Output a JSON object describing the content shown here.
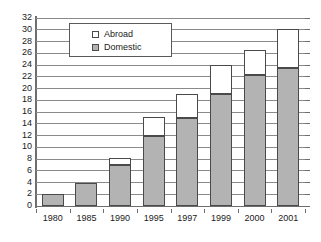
{
  "chart_data": {
    "type": "bar",
    "stacked": true,
    "title": "",
    "subtitle": "",
    "xlabel": "",
    "ylabel": "",
    "categories": [
      "1980",
      "1985",
      "1990",
      "1995",
      "1997",
      "1999",
      "2000",
      "2001"
    ],
    "series": [
      {
        "name": "Domestic",
        "color": "#b3b3b3",
        "values": [
          2,
          3.9,
          7,
          12,
          15,
          19,
          22.3,
          23.5
        ]
      },
      {
        "name": "Abroad",
        "color": "#ffffff",
        "values": [
          0,
          0,
          1.1,
          3.2,
          4,
          5,
          4.3,
          6.6
        ]
      }
    ],
    "totals": [
      2,
      3.9,
      8.1,
      15.2,
      19,
      24,
      26.6,
      30.1
    ],
    "ylim": [
      0,
      32
    ],
    "ytick_step": 2,
    "yticks": [
      "0",
      "2",
      "4",
      "6",
      "8",
      "10",
      "12",
      "14",
      "16",
      "18",
      "20",
      "22",
      "24",
      "26",
      "28",
      "30",
      "32"
    ],
    "grid": true,
    "grid_axis": "y",
    "legend_position": "upper-left-inside",
    "legend": [
      {
        "label": "Abroad",
        "swatch": "white-square"
      },
      {
        "label": "Domestic",
        "swatch": "gray-square"
      }
    ]
  },
  "colors": {
    "domestic": "#b3b3b3",
    "abroad": "#ffffff",
    "grid": "#8a8a8a",
    "axis": "#6e6e6e",
    "bar_outline": "#4a4a4a",
    "text": "#1a1a1a",
    "background": "#ffffff"
  }
}
